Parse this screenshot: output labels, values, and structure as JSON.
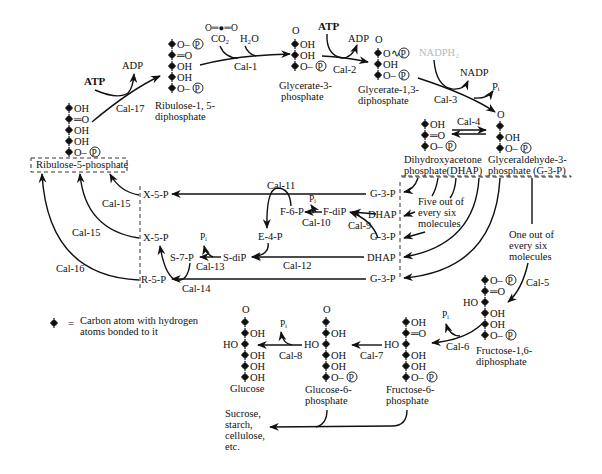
{
  "diagram": {
    "legend": {
      "symbol": "carbon-atom-marker",
      "equals": "=",
      "line1": "Carbon atom with hydrogen",
      "line2": "atoms bonded to it"
    },
    "reagents": {
      "co2_structure": "O═●═O",
      "co2": "CO₂",
      "h2o": "H₂O",
      "atp_left": "ATP",
      "adp_left": "ADP",
      "atp_top": "ATP",
      "adp_top": "ADP",
      "nadph2": "NADPH₂",
      "nadp": "NADP",
      "pi_cal3": "Pᵢ",
      "pi_cal10": "Pᵢ",
      "pi_cal13": "Pᵢ",
      "pi_cal6": "Pᵢ",
      "pi_cal8": "Pᵢ"
    },
    "enzymes": {
      "cal1": "Cal-1",
      "cal2": "Cal-2",
      "cal3": "Cal-3",
      "cal4": "Cal-4",
      "cal5": "Cal-5",
      "cal6": "Cal-6",
      "cal7": "Cal-7",
      "cal8": "Cal-8",
      "cal9": "Cal-9",
      "cal10": "Cal-10",
      "cal11": "Cal-11",
      "cal12": "Cal-12",
      "cal13": "Cal-13",
      "cal14": "Cal-14",
      "cal15a": "Cal-15",
      "cal15b": "Cal-15",
      "cal16": "Cal-16",
      "cal17": "Cal-17"
    },
    "compounds": {
      "ribulose_diphosphate": {
        "name1": "Ribulose-1, 5-",
        "name2": "diphosphate",
        "groups": [
          "O–Ⓟ",
          "═O",
          "OH",
          "OH",
          "O–Ⓟ"
        ]
      },
      "glycerate_3p": {
        "name1": "Glycerate-3-",
        "name2": "phosphate",
        "top": "O",
        "groups": [
          "OH",
          "OH",
          "O–Ⓟ"
        ]
      },
      "glycerate_13dp": {
        "name1": "Glycerate-1,3-",
        "name2": "diphosphate",
        "top": "O",
        "groups": [
          "O∿Ⓟ",
          "OH",
          "O–Ⓟ"
        ]
      },
      "g3p": {
        "name1": "Glyceraldehyde-3-",
        "name2": "phosphate",
        "abbr": "(G-3-P)",
        "top": "O",
        "groups": [
          "",
          "OH",
          "O–Ⓟ"
        ]
      },
      "dhap": {
        "name1": "Dihydroxyacetone",
        "name2": "phosphate(DHAP)",
        "groups": [
          "OH",
          "═O",
          "O–Ⓟ"
        ]
      },
      "ribulose_5p": {
        "name": "Ribulose-5-phosphate",
        "groups": [
          "OH",
          "═O",
          "OH",
          "OH",
          "O–Ⓟ"
        ]
      },
      "fructose_16dp": {
        "name1": "Fructose-1,6-",
        "name2": "diphosphate",
        "groups": [
          "O–Ⓟ",
          "═O",
          "HO",
          "OH",
          "OH",
          "O–Ⓟ"
        ]
      },
      "fructose_6p": {
        "name1": "Fructose-6-",
        "name2": "phosphate",
        "groups": [
          "OH",
          "═O",
          "HO",
          "OH",
          "OH",
          "O–Ⓟ"
        ]
      },
      "glucose_6p": {
        "name1": "Glucose-6-",
        "name2": "phosphate",
        "top": "O",
        "groups": [
          "",
          "OH",
          "HO",
          "OH",
          "OH",
          "O–Ⓟ"
        ]
      },
      "glucose": {
        "name": "Glucose",
        "top": "O",
        "groups": [
          "",
          "OH",
          "HO",
          "OH",
          "OH",
          "OH"
        ]
      }
    },
    "regen_box": {
      "right_column": [
        "G-3-P",
        "DHAP",
        "G-3-P",
        "DHAP",
        "G-3-P"
      ],
      "left_column": [
        "X-5-P",
        "X-5-P",
        "R-5-P"
      ],
      "intermediates": {
        "f6p": "F-6-P",
        "fdip": "F-diP",
        "e4p": "E-4-P",
        "sdip": "S-diP",
        "s7p": "S-7-P"
      }
    },
    "annotations": {
      "five_of_six": [
        "Five out of",
        "every six",
        "molecules"
      ],
      "one_of_six": [
        "One out of",
        "every six",
        "molecules"
      ],
      "products": [
        "Sucrose,",
        "starch,",
        "cellulose,",
        "etc."
      ]
    }
  }
}
